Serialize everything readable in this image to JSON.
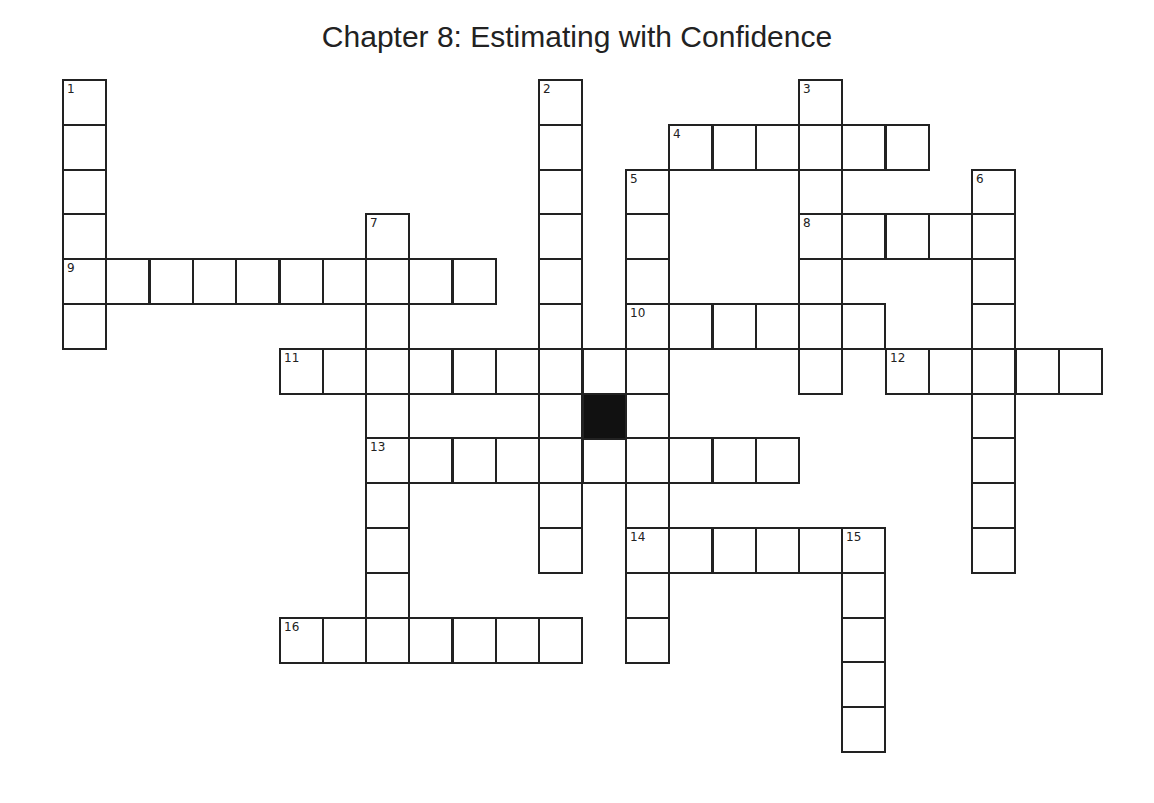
{
  "title": "Chapter 8: Estimating with Confidence",
  "grid": {
    "origin_x": 63,
    "origin_y": 80,
    "cell_w": 43.3,
    "cell_h": 44.8,
    "black_cells": [
      [
        12,
        7
      ]
    ]
  },
  "entries": [
    {
      "number": "1",
      "direction": "down",
      "col": 0,
      "row": 0,
      "length": 6
    },
    {
      "number": "2",
      "direction": "down",
      "col": 11,
      "row": 0,
      "length": 11
    },
    {
      "number": "3",
      "direction": "down",
      "col": 17,
      "row": 0,
      "length": 7
    },
    {
      "number": "4",
      "direction": "across",
      "col": 14,
      "row": 1,
      "length": 6
    },
    {
      "number": "5",
      "direction": "down",
      "col": 13,
      "row": 2,
      "length": 11
    },
    {
      "number": "6",
      "direction": "down",
      "col": 21,
      "row": 2,
      "length": 9
    },
    {
      "number": "7",
      "direction": "down",
      "col": 7,
      "row": 3,
      "length": 10
    },
    {
      "number": "8",
      "direction": "across",
      "col": 17,
      "row": 3,
      "length": 5
    },
    {
      "number": "9",
      "direction": "across",
      "col": 0,
      "row": 4,
      "length": 10
    },
    {
      "number": "10",
      "direction": "across",
      "col": 13,
      "row": 5,
      "length": 6
    },
    {
      "number": "11",
      "direction": "across",
      "col": 5,
      "row": 6,
      "length": 9
    },
    {
      "number": "12",
      "direction": "across",
      "col": 19,
      "row": 6,
      "length": 5
    },
    {
      "number": "13",
      "direction": "across",
      "col": 7,
      "row": 8,
      "length": 10
    },
    {
      "number": "14",
      "direction": "across",
      "col": 13,
      "row": 10,
      "length": 6
    },
    {
      "number": "15",
      "direction": "down",
      "col": 18,
      "row": 10,
      "length": 5
    },
    {
      "number": "16",
      "direction": "across",
      "col": 5,
      "row": 12,
      "length": 7
    }
  ]
}
